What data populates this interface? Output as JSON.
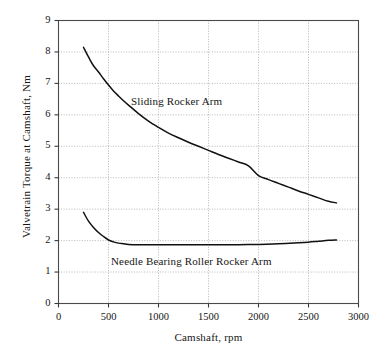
{
  "chart_data": {
    "type": "line",
    "title": "",
    "xlabel": "Camshaft, rpm",
    "ylabel": "Valvetrain Torque at Camshaft, Nm",
    "xlim": [
      0,
      3000
    ],
    "ylim": [
      0,
      9
    ],
    "xticks": [
      0,
      500,
      1000,
      1500,
      2000,
      2500,
      3000
    ],
    "yticks": [
      0,
      1,
      2,
      3,
      4,
      5,
      6,
      7,
      8,
      9
    ],
    "xtick_labels": [
      "0",
      "500",
      "1000",
      "1500",
      "2000",
      "2500",
      "3000"
    ],
    "ytick_labels": [
      "0",
      "1",
      "2",
      "3",
      "4",
      "5",
      "6",
      "7",
      "8",
      "9"
    ],
    "grid": true,
    "grid_style": "dotted",
    "grid_color": "#9a9a9a",
    "legend_position": "inline-annotation",
    "line_color": "#111111",
    "series": [
      {
        "name": "Sliding Rocker Arm",
        "label_x": 1180,
        "label_y": 6.45,
        "x": [
          250,
          300,
          350,
          400,
          450,
          500,
          550,
          600,
          650,
          700,
          800,
          900,
          1000,
          1100,
          1200,
          1300,
          1400,
          1500,
          1600,
          1700,
          1800,
          1900,
          2000,
          2100,
          2200,
          2300,
          2400,
          2500,
          2600,
          2700,
          2780
        ],
        "values": [
          8.15,
          7.84,
          7.56,
          7.36,
          7.15,
          6.95,
          6.76,
          6.6,
          6.45,
          6.31,
          6.04,
          5.8,
          5.6,
          5.42,
          5.27,
          5.13,
          5.0,
          4.87,
          4.74,
          4.62,
          4.5,
          4.38,
          4.07,
          3.94,
          3.82,
          3.7,
          3.58,
          3.47,
          3.36,
          3.25,
          3.2
        ]
      },
      {
        "name": "Needle Bearing Roller Rocker Arm",
        "label_x": 1330,
        "label_y": 1.35,
        "x": [
          250,
          300,
          350,
          400,
          450,
          500,
          550,
          600,
          650,
          700,
          800,
          900,
          1000,
          1200,
          1400,
          1600,
          1800,
          2000,
          2200,
          2400,
          2500,
          2600,
          2700,
          2780
        ],
        "values": [
          2.9,
          2.62,
          2.42,
          2.26,
          2.13,
          2.02,
          1.96,
          1.92,
          1.9,
          1.88,
          1.87,
          1.87,
          1.87,
          1.87,
          1.87,
          1.87,
          1.87,
          1.88,
          1.9,
          1.93,
          1.95,
          1.98,
          2.01,
          2.02
        ]
      }
    ]
  }
}
